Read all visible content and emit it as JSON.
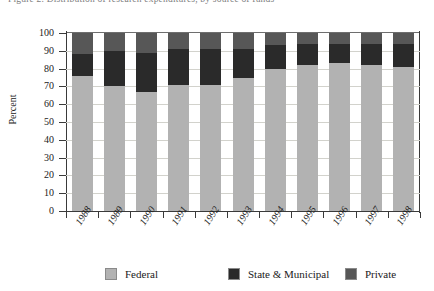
{
  "figure": {
    "title": "Figure 2.  Distribution of research expenditures, by source of funds",
    "ylabel": "Percent"
  },
  "legend": {
    "items": [
      {
        "label": "Federal",
        "color": "#b2b2b2",
        "key": "federal"
      },
      {
        "label": "State & Municipal",
        "color": "#2a2a2a",
        "key": "state"
      },
      {
        "label": "Private",
        "color": "#575757",
        "key": "private"
      }
    ]
  },
  "chart_data": {
    "type": "bar",
    "subtype": "stacked-bar-100",
    "title": "Figure 2.  Distribution of research expenditures, by source of funds",
    "xlabel": "",
    "ylabel": "Percent",
    "ylim": [
      0,
      100
    ],
    "yticks": [
      0,
      10,
      20,
      30,
      40,
      50,
      60,
      70,
      80,
      90,
      100
    ],
    "grid": true,
    "legend_position": "bottom",
    "categories": [
      "1988",
      "1989",
      "1990",
      "1991",
      "1992",
      "1993",
      "1994",
      "1995",
      "1996",
      "1997",
      "1998"
    ],
    "series": [
      {
        "name": "Federal",
        "color": "#b2b2b2",
        "values": [
          76,
          70,
          67,
          71,
          71,
          75,
          80,
          82,
          83,
          82,
          81
        ]
      },
      {
        "name": "State & Municipal",
        "color": "#2a2a2a",
        "values": [
          12,
          20,
          22,
          20,
          20,
          16,
          13,
          12,
          11,
          12,
          13
        ]
      },
      {
        "name": "Private",
        "color": "#575757",
        "values": [
          12,
          10,
          11,
          9,
          9,
          9,
          7,
          6,
          6,
          6,
          6
        ]
      }
    ]
  }
}
